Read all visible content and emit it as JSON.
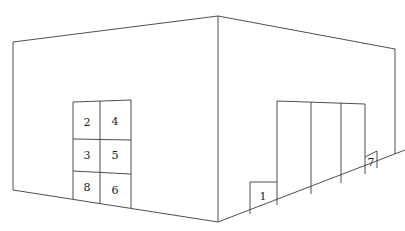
{
  "diagram": {
    "type": "perspective-room-corner",
    "left_wall": {
      "grid_labels": [
        {
          "id": "2",
          "row": 1,
          "col": 1
        },
        {
          "id": "4",
          "row": 1,
          "col": 2
        },
        {
          "id": "3",
          "row": 2,
          "col": 1
        },
        {
          "id": "5",
          "row": 2,
          "col": 2
        },
        {
          "id": "8",
          "row": 3,
          "col": 1
        },
        {
          "id": "6",
          "row": 3,
          "col": 2
        }
      ]
    },
    "right_wall": {
      "labels": [
        {
          "id": "1"
        },
        {
          "id": "7"
        }
      ]
    },
    "colors": {
      "line": "#3a3a3a",
      "background": "#ffffff",
      "text": "#222222"
    }
  }
}
